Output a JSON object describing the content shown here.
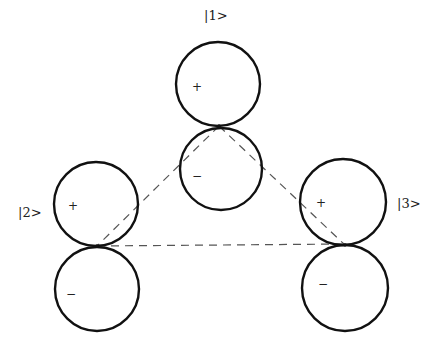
{
  "diagram": {
    "type": "p-orbital triangle (three lobed orbitals with dashed overlap triangle)",
    "colors": {
      "background": "#ffffff",
      "orbital_stroke": "#111111",
      "dashed_line": "#555555",
      "text": "#222222"
    },
    "states": [
      {
        "id": "s1",
        "label": "|1>",
        "label_pos": [
          204,
          20
        ],
        "upper_lobe": {
          "cx": 218,
          "cy": 84,
          "r": 42,
          "sign": "+",
          "sign_pos": [
            192,
            91
          ]
        },
        "lower_lobe": {
          "cx": 221,
          "cy": 169,
          "r": 41,
          "sign": "−",
          "sign_pos": [
            192,
            180
          ]
        },
        "node": [
          219,
          126
        ]
      },
      {
        "id": "s2",
        "label": "|2>",
        "label_pos": [
          18,
          217
        ],
        "upper_lobe": {
          "cx": 96,
          "cy": 204,
          "r": 42,
          "sign": "+",
          "sign_pos": [
            68,
            210
          ]
        },
        "lower_lobe": {
          "cx": 97,
          "cy": 289,
          "r": 42,
          "sign": "−",
          "sign_pos": [
            66,
            298
          ]
        },
        "node": [
          97,
          246
        ]
      },
      {
        "id": "s3",
        "label": "|3>",
        "label_pos": [
          397,
          208
        ],
        "upper_lobe": {
          "cx": 343,
          "cy": 202,
          "r": 43,
          "sign": "+",
          "sign_pos": [
            316,
            207
          ]
        },
        "lower_lobe": {
          "cx": 345,
          "cy": 288,
          "r": 43,
          "sign": "−",
          "sign_pos": [
            318,
            288
          ]
        },
        "node": [
          345,
          245
        ]
      }
    ],
    "bonds": [
      {
        "from": "s1",
        "to": "s2",
        "x1": 219,
        "y1": 126,
        "x2": 97,
        "y2": 246
      },
      {
        "from": "s1",
        "to": "s3",
        "x1": 219,
        "y1": 126,
        "x2": 345,
        "y2": 245
      },
      {
        "from": "s2",
        "to": "s3",
        "x1": 97,
        "y1": 246,
        "x2": 345,
        "y2": 244
      }
    ]
  }
}
